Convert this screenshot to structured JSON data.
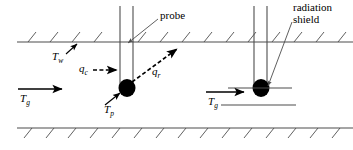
{
  "figure": {
    "colors": {
      "line": "#4d4d4d",
      "ink": "#000000",
      "background": "#ffffff"
    },
    "labels": {
      "probe": "probe",
      "radiation_shield_line1": "radiation",
      "radiation_shield_line2": "shield",
      "wall_temp_symbol": "T",
      "wall_temp_subscript": "w",
      "gas_temp_symbol": "T",
      "gas_temp_subscript": "g",
      "probe_temp_symbol": "T",
      "probe_temp_subscript": "p",
      "convection_symbol": "q",
      "convection_subscript": "c",
      "radiation_symbol": "q",
      "radiation_subscript": "r",
      "gas_temp_symbol_right": "T",
      "gas_temp_subscript_right": "g"
    },
    "geometry": {
      "top_wall_y": 42,
      "bottom_wall_y": 128,
      "left_probe_x": 124,
      "right_probe_x": 258,
      "bead_left": {
        "cx": 127,
        "cy": 88,
        "rx": 8,
        "ry": 9
      },
      "bead_right": {
        "cx": 261,
        "cy": 88,
        "rx": 8,
        "ry": 9
      },
      "shield_bar_upper": {
        "x1": 228,
        "x2": 290,
        "y": 88
      },
      "shield_bar_lower": {
        "x1": 221,
        "x2": 295,
        "y": 104
      }
    }
  }
}
